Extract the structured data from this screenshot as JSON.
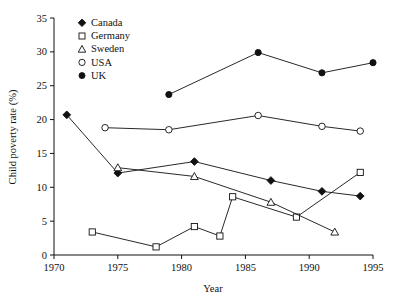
{
  "chart_data": {
    "type": "line",
    "title": "",
    "xlabel": "Year",
    "ylabel": "Child poverty rate (%)",
    "xlim": [
      1970,
      1995
    ],
    "ylim": [
      0,
      35
    ],
    "xticks": [
      1970,
      1975,
      1980,
      1985,
      1990,
      1995
    ],
    "yticks": [
      0,
      5,
      10,
      15,
      20,
      25,
      30,
      35
    ],
    "grid": false,
    "legend_position": "top-left-inside",
    "series": [
      {
        "name": "Canada",
        "marker": "filled-diamond",
        "x": [
          1971,
          1975,
          1981,
          1987,
          1991,
          1994
        ],
        "y": [
          20.7,
          12.1,
          13.8,
          11.0,
          9.4,
          8.7
        ]
      },
      {
        "name": "Germany",
        "marker": "open-square",
        "x": [
          1973,
          1978,
          1981,
          1983,
          1984,
          1989,
          1994
        ],
        "y": [
          3.4,
          1.2,
          4.2,
          2.8,
          8.6,
          5.6,
          12.2
        ]
      },
      {
        "name": "Sweden",
        "marker": "open-triangle",
        "x": [
          1975,
          1981,
          1987,
          1992
        ],
        "y": [
          12.9,
          11.6,
          7.8,
          3.4
        ]
      },
      {
        "name": "USA",
        "marker": "open-circle",
        "x": [
          1974,
          1979,
          1986,
          1991,
          1994
        ],
        "y": [
          18.8,
          18.5,
          20.6,
          19.0,
          18.3
        ]
      },
      {
        "name": "UK",
        "marker": "filled-circle",
        "x": [
          1979,
          1986,
          1991,
          1995
        ],
        "y": [
          23.7,
          29.9,
          26.9,
          28.4
        ]
      }
    ]
  },
  "legend": {
    "entries": [
      {
        "label": "Canada",
        "marker": "filled-diamond"
      },
      {
        "label": "Germany",
        "marker": "open-square"
      },
      {
        "label": "Sweden",
        "marker": "open-triangle"
      },
      {
        "label": "USA",
        "marker": "open-circle"
      },
      {
        "label": "UK",
        "marker": "filled-circle"
      }
    ]
  },
  "axes": {
    "x_title": "Year",
    "y_title": "Child poverty rate (%)",
    "x_tick_labels": [
      "1970",
      "1975",
      "1980",
      "1985",
      "1990",
      "1995"
    ],
    "y_tick_labels": [
      "0",
      "5",
      "10",
      "15",
      "20",
      "25",
      "30",
      "35"
    ]
  },
  "colors": {
    "ink": "#111111",
    "background": "#ffffff"
  }
}
